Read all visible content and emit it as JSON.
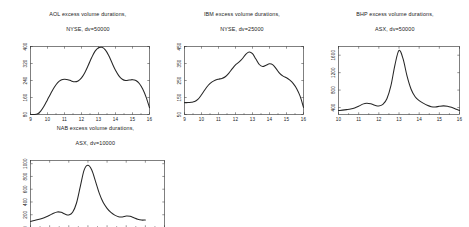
{
  "figure": {
    "background": "#ffffff",
    "line_color": "#262626",
    "axis_color": "#2b2b2b",
    "panel_count": 4
  },
  "panels": [
    {
      "id": "aol",
      "title_line1": "AOL excess volume durations,",
      "title_line2": "NYSE, dv=50000"
    },
    {
      "id": "ibm",
      "title_line1": "IBM excess volume durations,",
      "title_line2": "NYSE, dv=25000"
    },
    {
      "id": "bhp",
      "title_line1": "BHP excess volume durations,",
      "title_line2": "ASX, dv=50000"
    },
    {
      "id": "nab",
      "title_line1": "NAB excess volume durations,",
      "title_line2": "ASX, dv=10000"
    }
  ],
  "chart_data": [
    {
      "type": "line",
      "id": "aol",
      "title": "AOL excess volume durations, NYSE, dv=50000",
      "xlabel": "",
      "ylabel": "",
      "xlim": [
        9,
        16
      ],
      "ylim": [
        80,
        400
      ],
      "xticks": [
        9,
        10,
        11,
        12,
        13,
        14,
        15,
        16
      ],
      "xticklabels": [
        "9",
        "10",
        "11",
        "12",
        "13",
        "14",
        "15",
        "16"
      ],
      "yticks": [
        80,
        160,
        240,
        320,
        400
      ],
      "yticklabels": [
        "80",
        "160",
        "240",
        "320",
        "400"
      ],
      "grid": false,
      "legend": null,
      "x": [
        9.0,
        9.2,
        9.4,
        9.6,
        9.8,
        10.0,
        10.2,
        10.4,
        10.6,
        10.8,
        11.0,
        11.2,
        11.4,
        11.6,
        11.8,
        12.0,
        12.2,
        12.4,
        12.6,
        12.8,
        13.0,
        13.2,
        13.4,
        13.6,
        13.8,
        14.0,
        14.2,
        14.4,
        14.6,
        14.8,
        15.0,
        15.2,
        15.4,
        15.6,
        15.8,
        16.0
      ],
      "y": [
        80,
        80,
        82,
        96,
        120,
        150,
        180,
        208,
        230,
        242,
        246,
        244,
        238,
        234,
        238,
        252,
        278,
        312,
        348,
        378,
        394,
        396,
        384,
        358,
        322,
        288,
        262,
        246,
        240,
        242,
        244,
        240,
        226,
        200,
        162,
        112
      ]
    },
    {
      "type": "line",
      "id": "ibm",
      "title": "IBM excess volume durations, NYSE, dv=25000",
      "xlabel": "",
      "ylabel": "",
      "xlim": [
        9,
        16
      ],
      "ylim": [
        50,
        450
      ],
      "xticks": [
        9,
        10,
        11,
        12,
        13,
        14,
        15,
        16
      ],
      "xticklabels": [
        "9",
        "10",
        "11",
        "12",
        "13",
        "14",
        "15",
        "16"
      ],
      "yticks": [
        50,
        150,
        250,
        350,
        450
      ],
      "yticklabels": [
        "50",
        "150",
        "250",
        "350",
        "450"
      ],
      "grid": false,
      "legend": null,
      "x": [
        9.0,
        9.2,
        9.4,
        9.6,
        9.8,
        10.0,
        10.2,
        10.4,
        10.6,
        10.8,
        11.0,
        11.2,
        11.4,
        11.6,
        11.8,
        12.0,
        12.2,
        12.4,
        12.6,
        12.8,
        13.0,
        13.2,
        13.4,
        13.6,
        13.8,
        14.0,
        14.2,
        14.4,
        14.6,
        14.8,
        15.0,
        15.2,
        15.4,
        15.6,
        15.8,
        16.0
      ],
      "y": [
        120,
        120,
        122,
        126,
        140,
        166,
        196,
        222,
        240,
        252,
        258,
        262,
        272,
        292,
        318,
        342,
        358,
        378,
        404,
        418,
        408,
        376,
        344,
        332,
        340,
        348,
        342,
        318,
        292,
        276,
        266,
        252,
        232,
        202,
        158,
        92
      ]
    },
    {
      "type": "line",
      "id": "bhp",
      "title": "BHP excess volume durations, ASX, dv=50000",
      "xlabel": "",
      "ylabel": "",
      "xlim": [
        10,
        16
      ],
      "ylim": [
        240,
        1800
      ],
      "xticks": [
        10,
        11,
        12,
        13,
        14,
        15,
        16
      ],
      "xticklabels": [
        "10",
        "11",
        "12",
        "13",
        "14",
        "15",
        "16"
      ],
      "yticks": [
        400,
        800,
        1200,
        1600
      ],
      "yticklabels": [
        "400",
        "800",
        "1200",
        "1600"
      ],
      "grid": false,
      "legend": null,
      "x": [
        10.0,
        10.2,
        10.4,
        10.6,
        10.8,
        11.0,
        11.2,
        11.4,
        11.6,
        11.8,
        12.0,
        12.2,
        12.4,
        12.6,
        12.8,
        13.0,
        13.2,
        13.4,
        13.6,
        13.8,
        14.0,
        14.2,
        14.4,
        14.6,
        14.8,
        15.0,
        15.2,
        15.4,
        15.6,
        15.8,
        16.0
      ],
      "y": [
        330,
        340,
        352,
        366,
        390,
        430,
        478,
        500,
        486,
        452,
        436,
        470,
        600,
        900,
        1380,
        1710,
        1520,
        1120,
        820,
        648,
        560,
        500,
        452,
        420,
        412,
        428,
        438,
        430,
        404,
        368,
        330
      ]
    },
    {
      "type": "line",
      "id": "nab",
      "title": "NAB excess volume durations, ASX, dv=10000",
      "xlabel": "",
      "ylabel": "",
      "xlim": [
        10,
        17
      ],
      "ylim": [
        0,
        1050
      ],
      "xticks": [
        10,
        11,
        12,
        13,
        14,
        15,
        16,
        17
      ],
      "xticklabels": [
        "10",
        "11",
        "12",
        "13",
        "14",
        "15",
        "16",
        "17"
      ],
      "yticks": [
        0,
        200,
        400,
        600,
        800,
        1000
      ],
      "yticklabels": [
        "0",
        "200",
        "400",
        "600",
        "800",
        "1000"
      ],
      "grid": false,
      "legend": null,
      "x": [
        10.0,
        10.2,
        10.4,
        10.6,
        10.8,
        11.0,
        11.2,
        11.4,
        11.6,
        11.8,
        12.0,
        12.2,
        12.4,
        12.6,
        12.8,
        13.0,
        13.2,
        13.4,
        13.6,
        13.8,
        14.0,
        14.2,
        14.4,
        14.6,
        14.8,
        15.0,
        15.2,
        15.4,
        15.6,
        15.8,
        16.0
      ],
      "y": [
        95,
        108,
        124,
        142,
        164,
        192,
        224,
        244,
        238,
        210,
        196,
        238,
        380,
        640,
        900,
        975,
        900,
        720,
        530,
        390,
        300,
        236,
        194,
        168,
        166,
        180,
        176,
        152,
        128,
        116,
        118
      ]
    }
  ]
}
